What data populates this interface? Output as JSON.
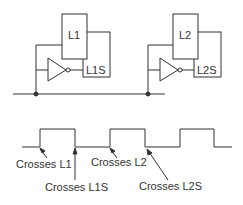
{
  "circuit": {
    "stage1": {
      "latch_label": "L1",
      "slave_label": "L1S"
    },
    "stage2": {
      "latch_label": "L2",
      "slave_label": "L2S"
    }
  },
  "waveform": {
    "annotations": [
      {
        "id": "a1",
        "text": "Crosses L1"
      },
      {
        "id": "a2",
        "text": "Crosses L1S"
      },
      {
        "id": "a3",
        "text": "Crosses L2"
      },
      {
        "id": "a4",
        "text": "Crosses L2S"
      }
    ]
  },
  "colors": {
    "line": "#333333",
    "background": "#ffffff"
  }
}
